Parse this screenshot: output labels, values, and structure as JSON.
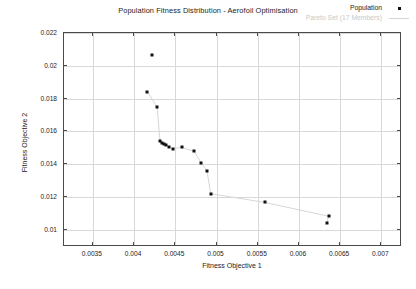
{
  "chart_data": {
    "type": "scatter",
    "title": "Population Fitness Distribution - Aerofoil Optimisation",
    "xlabel": "Fitness Objective 1",
    "ylabel": "Fitness Objective 2",
    "xlim": [
      0.00315,
      0.00725
    ],
    "ylim": [
      0.00895,
      0.022
    ],
    "xticks": [
      0.0035,
      0.004,
      0.0045,
      0.005,
      0.0055,
      0.006,
      0.0065,
      0.007
    ],
    "xticklabels": [
      "0.0035",
      "0.004",
      "0.0045",
      "0.005",
      "0.0055",
      "0.006",
      "0.0065",
      "0.007"
    ],
    "yticks": [
      0.01,
      0.012,
      0.014,
      0.016,
      0.018,
      0.02,
      0.022
    ],
    "yticklabels": [
      "0.01",
      "0.012",
      "0.014",
      "0.016",
      "0.018",
      "0.02",
      "0.022"
    ],
    "grid": true,
    "legend_position": "top-right",
    "legend": [
      {
        "name": "Population",
        "marker": "dot",
        "color": "#111111"
      },
      {
        "name": "Pareto Set (17 Members)",
        "marker": "line",
        "color": "#d5d5d5"
      }
    ],
    "series": [
      {
        "name": "Population",
        "marker": "square-dot",
        "color": "#111111",
        "points": [
          {
            "x": 0.004217,
            "y": 0.02064
          },
          {
            "x": 0.00416,
            "y": 0.01843
          },
          {
            "x": 0.00428,
            "y": 0.01747
          },
          {
            "x": 0.004315,
            "y": 0.01539
          },
          {
            "x": 0.004338,
            "y": 0.0153
          },
          {
            "x": 0.00436,
            "y": 0.01525
          },
          {
            "x": 0.00439,
            "y": 0.01516
          },
          {
            "x": 0.00442,
            "y": 0.01506
          },
          {
            "x": 0.00447,
            "y": 0.01495
          },
          {
            "x": 0.004575,
            "y": 0.01503
          },
          {
            "x": 0.00473,
            "y": 0.01478
          },
          {
            "x": 0.004815,
            "y": 0.01407
          },
          {
            "x": 0.004885,
            "y": 0.0136
          },
          {
            "x": 0.00493,
            "y": 0.0122
          },
          {
            "x": 0.005585,
            "y": 0.01167
          },
          {
            "x": 0.00636,
            "y": 0.01082
          },
          {
            "x": 0.006335,
            "y": 0.01039
          }
        ]
      }
    ],
    "pareto_set": {
      "name": "Pareto Set (17 Members)",
      "color": "#d5d5d5",
      "members": 17,
      "points": [
        {
          "x": 0.00416,
          "y": 0.01843
        },
        {
          "x": 0.00428,
          "y": 0.01747
        },
        {
          "x": 0.004315,
          "y": 0.01539
        },
        {
          "x": 0.004338,
          "y": 0.0153
        },
        {
          "x": 0.00436,
          "y": 0.01525
        },
        {
          "x": 0.00439,
          "y": 0.01516
        },
        {
          "x": 0.00442,
          "y": 0.01506
        },
        {
          "x": 0.00447,
          "y": 0.01495
        },
        {
          "x": 0.004575,
          "y": 0.01503
        },
        {
          "x": 0.00473,
          "y": 0.01478
        },
        {
          "x": 0.004815,
          "y": 0.01407
        },
        {
          "x": 0.004885,
          "y": 0.0136
        },
        {
          "x": 0.00493,
          "y": 0.0122
        },
        {
          "x": 0.005585,
          "y": 0.01167
        },
        {
          "x": 0.00636,
          "y": 0.01082
        },
        {
          "x": 0.006335,
          "y": 0.01039
        }
      ]
    }
  }
}
